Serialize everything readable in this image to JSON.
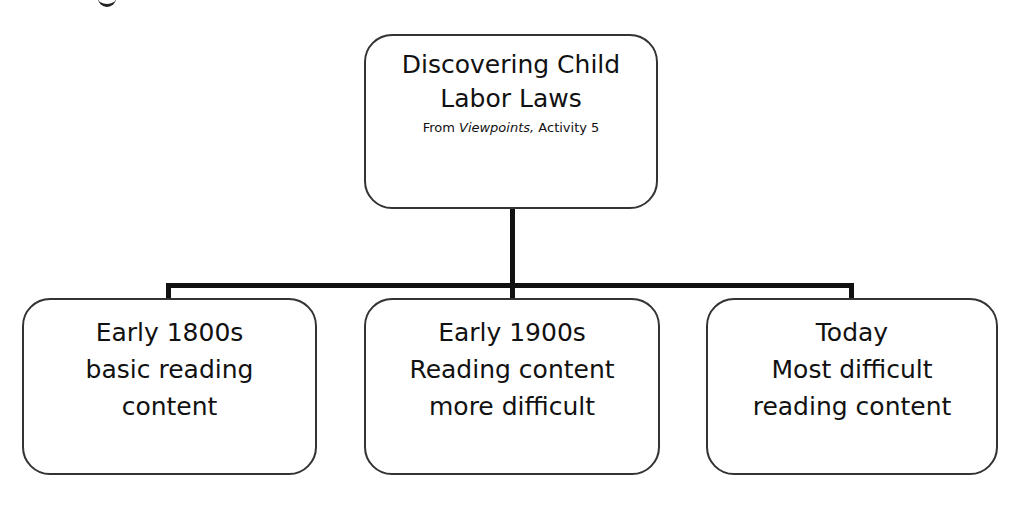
{
  "diagram": {
    "type": "hierarchy",
    "root": {
      "title_lines": [
        "Discovering Child",
        "Labor Laws"
      ],
      "subtitle_prefix": "From ",
      "subtitle_italic": "Viewpoints,",
      "subtitle_suffix": " Activity 5"
    },
    "children": [
      {
        "lines": [
          "Early 1800s",
          "basic reading",
          "content"
        ]
      },
      {
        "lines": [
          "Early 1900s",
          "Reading content",
          "more difficult"
        ]
      },
      {
        "lines": [
          "Today",
          "Most difficult",
          "reading content"
        ]
      }
    ],
    "colors": {
      "line": "#111111",
      "border": "#333333",
      "background": "#ffffff"
    }
  }
}
